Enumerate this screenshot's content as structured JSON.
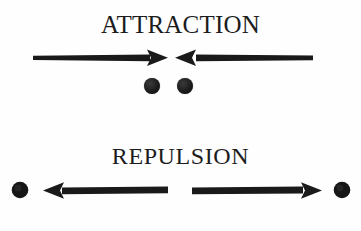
{
  "figure": {
    "background_color": "#fefefe",
    "ink_color": "#1a1a1a",
    "width": 361,
    "height": 231
  },
  "panels": [
    {
      "id": "attraction",
      "label": "ATTRACTION",
      "description": "Two particles with arrows pointing inward toward each other",
      "arrows": [
        {
          "name": "left-arrow",
          "direction": "right",
          "x_start": 33,
          "x_end": 168,
          "y": 58
        },
        {
          "name": "right-arrow",
          "direction": "left",
          "x_start": 313,
          "x_end": 175,
          "y": 58
        }
      ],
      "particles": [
        {
          "name": "left-particle",
          "cx": 152,
          "cy": 86,
          "r": 8
        },
        {
          "name": "right-particle",
          "cx": 185,
          "cy": 86,
          "r": 8
        }
      ]
    },
    {
      "id": "repulsion",
      "label": "REPULSION",
      "description": "Two particles with arrows pointing outward away from each other",
      "arrows": [
        {
          "name": "left-arrow",
          "direction": "left",
          "x_start": 168,
          "x_end": 43,
          "y": 190
        },
        {
          "name": "right-arrow",
          "direction": "right",
          "x_start": 192,
          "x_end": 322,
          "y": 190
        }
      ],
      "particles": [
        {
          "name": "left-particle",
          "cx": 20,
          "cy": 190,
          "r": 8
        },
        {
          "name": "right-particle",
          "cx": 342,
          "cy": 190,
          "r": 8
        }
      ]
    }
  ]
}
